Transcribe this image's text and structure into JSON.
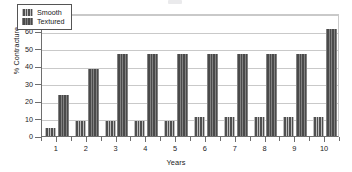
{
  "chart_data": {
    "type": "bar",
    "title": "",
    "xlabel": "Years",
    "ylabel": "% Contracture",
    "categories": [
      "1",
      "2",
      "3",
      "4",
      "5",
      "6",
      "7",
      "8",
      "9",
      "10"
    ],
    "series": [
      {
        "name": "Smooth",
        "swatch": "striped-dark-gray",
        "color": "#4f4f4f",
        "values": [
          4.5,
          8.5,
          8.5,
          8.5,
          8.5,
          11,
          11,
          11,
          11,
          11
        ]
      },
      {
        "name": "Textured",
        "swatch": "solid-dark-gray",
        "color": "#4a4a4a",
        "values": [
          23.5,
          38,
          46.5,
          46.5,
          46.5,
          46.5,
          46.5,
          46.5,
          46.5,
          61
        ]
      }
    ],
    "ylim": [
      0,
      70
    ],
    "yticks": [
      0,
      10,
      20,
      30,
      40,
      50,
      60,
      70
    ],
    "ytick_labels": [
      "0",
      "10",
      "20",
      "30",
      "40",
      "50",
      "60",
      "70"
    ],
    "grid": "horizontal",
    "legend_position": "upper-left-inside"
  },
  "legend": {
    "items": [
      {
        "label": "Smooth"
      },
      {
        "label": "Textured"
      }
    ]
  }
}
